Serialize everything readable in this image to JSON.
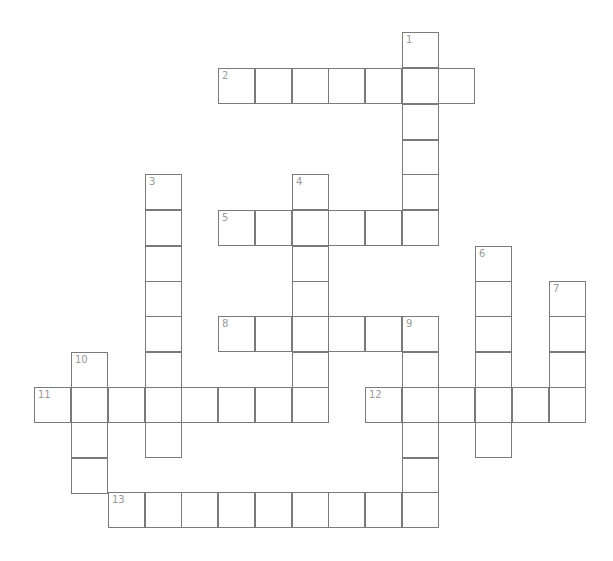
{
  "puzzle": {
    "type": "crossword",
    "grid": {
      "origin_x": 34,
      "origin_y": 32,
      "col_x": [
        34,
        71,
        108,
        145,
        181,
        218,
        255,
        292,
        328,
        365,
        402,
        438,
        475,
        512,
        549
      ],
      "row_y": [
        32,
        68,
        104,
        140,
        174,
        210,
        246,
        281,
        316,
        352,
        387,
        422,
        458,
        492
      ],
      "line_color": "#7a7a7a",
      "number_color": "#9a9a9a"
    },
    "words": [
      {
        "number": "1",
        "direction": "down",
        "row": 0,
        "col": 10,
        "length": 6
      },
      {
        "number": "2",
        "direction": "across",
        "row": 1,
        "col": 5,
        "length": 7
      },
      {
        "number": "3",
        "direction": "down",
        "row": 4,
        "col": 3,
        "length": 8
      },
      {
        "number": "4",
        "direction": "down",
        "row": 4,
        "col": 7,
        "length": 7
      },
      {
        "number": "5",
        "direction": "across",
        "row": 5,
        "col": 5,
        "length": 6
      },
      {
        "number": "6",
        "direction": "down",
        "row": 6,
        "col": 12,
        "length": 6
      },
      {
        "number": "7",
        "direction": "down",
        "row": 7,
        "col": 14,
        "length": 4
      },
      {
        "number": "8",
        "direction": "across",
        "row": 8,
        "col": 5,
        "length": 6
      },
      {
        "number": "9",
        "direction": "down",
        "row": 8,
        "col": 10,
        "length": 6
      },
      {
        "number": "10",
        "direction": "down",
        "row": 9,
        "col": 1,
        "length": 4
      },
      {
        "number": "11",
        "direction": "across",
        "row": 10,
        "col": 0,
        "length": 8
      },
      {
        "number": "12",
        "direction": "across",
        "row": 10,
        "col": 9,
        "length": 6
      },
      {
        "number": "13",
        "direction": "across",
        "row": 13,
        "col": 2,
        "length": 9
      }
    ]
  }
}
